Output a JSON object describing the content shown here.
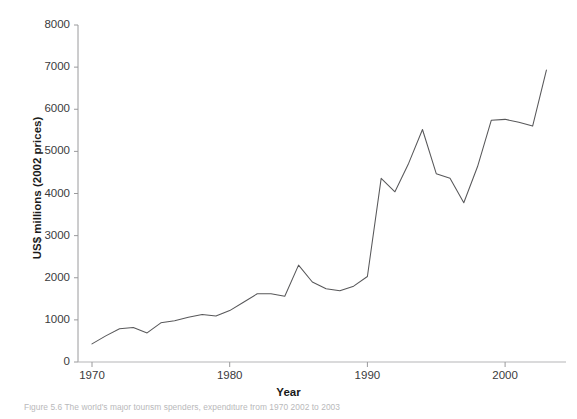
{
  "figure": {
    "top_partial_text": "",
    "caption_partial_text": "Figure 5.6 The world's major tourism spenders, expenditure from 1970 2002 to 2003",
    "line_color": "#58585a",
    "text_color": "#231f20",
    "tick_color": "#3a3a3c",
    "background": "#ffffff"
  },
  "chart_data": {
    "type": "line",
    "title": "",
    "subtitle": "",
    "xlabel": "Year",
    "ylabel": "US$ millions (2002 prices)",
    "xlim": [
      1970,
      2004
    ],
    "ylim": [
      0,
      8000
    ],
    "xticks": [
      1970,
      1980,
      1990,
      2000
    ],
    "xtick_labels": [
      "1970",
      "1980",
      "1990",
      "2000"
    ],
    "yticks": [
      0,
      1000,
      2000,
      3000,
      4000,
      5000,
      6000,
      7000,
      8000
    ],
    "ytick_labels": [
      "0",
      "1000",
      "2000",
      "3000",
      "4000",
      "5000",
      "6000",
      "7000",
      "8000"
    ],
    "grid": false,
    "legend": null,
    "legend_position": "none",
    "series": [
      {
        "name": "Expenditure",
        "color": "#58585a",
        "x": [
          1970,
          1971,
          1972,
          1973,
          1974,
          1975,
          1976,
          1977,
          1978,
          1979,
          1980,
          1981,
          1982,
          1983,
          1984,
          1985,
          1986,
          1987,
          1988,
          1989,
          1990,
          1991,
          1992,
          1993,
          1994,
          1995,
          1996,
          1997,
          1998,
          1999,
          2000,
          2001,
          2002,
          2003
        ],
        "values": [
          430,
          620,
          790,
          820,
          690,
          930,
          980,
          1060,
          1130,
          1090,
          1220,
          1420,
          1620,
          1620,
          1560,
          2300,
          1900,
          1740,
          1690,
          1800,
          2030,
          4360,
          4040,
          4720,
          5520,
          4470,
          4360,
          3780,
          4640,
          5740,
          5760,
          5690,
          5600,
          6930
        ]
      }
    ]
  }
}
